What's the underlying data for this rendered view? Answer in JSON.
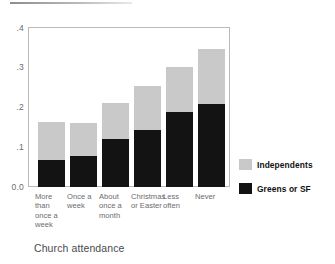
{
  "chart_data": {
    "type": "bar",
    "subtype": "stacked",
    "title": "",
    "xlabel": "Church attendance",
    "ylabel": "",
    "ylim": [
      0.0,
      0.4
    ],
    "yticks": [
      "0.0",
      ".1",
      ".2",
      ".3",
      ".4"
    ],
    "ytick_values": [
      0.0,
      0.1,
      0.2,
      0.3,
      0.4
    ],
    "grid": false,
    "legend_position": "right",
    "categories": [
      "More than once a week",
      "Once a week",
      "About once a month",
      "Christmas or Easter",
      "Less often",
      "Never"
    ],
    "category_labels": [
      "More\nthan\nonce a\nweek",
      "Once a\nweek",
      "About\nonce a\nmonth",
      "Christmas\nor Easter",
      "Less\noften",
      "Never"
    ],
    "series": [
      {
        "name": "Greens or SF",
        "color": "#131313",
        "values": [
          0.068,
          0.077,
          0.122,
          0.143,
          0.188,
          0.21
        ]
      },
      {
        "name": "Independents",
        "color": "#c9c9c9",
        "values": [
          0.095,
          0.085,
          0.09,
          0.11,
          0.115,
          0.138
        ]
      }
    ],
    "totals": [
      0.163,
      0.162,
      0.212,
      0.253,
      0.303,
      0.348
    ]
  },
  "axis": {
    "y_labels": [
      {
        "text": ".4",
        "value": 0.4
      },
      {
        "text": ".3",
        "value": 0.3
      },
      {
        "text": ".2",
        "value": 0.2
      },
      {
        "text": ".1",
        "value": 0.1
      },
      {
        "text": "0.0",
        "value": 0.0
      }
    ],
    "x_title": "Church attendance"
  },
  "legend": {
    "entries": [
      {
        "label": "Independents",
        "color": "#c9c9c9"
      },
      {
        "label": "Greens or SF",
        "color": "#131313"
      }
    ]
  },
  "x_labels": [
    {
      "line1": "More",
      "line2": "than",
      "line3": "once a",
      "line4": "week"
    },
    {
      "line1": "Once a",
      "line2": "week",
      "line3": "",
      "line4": ""
    },
    {
      "line1": "About",
      "line2": "once a",
      "line3": "month",
      "line4": ""
    },
    {
      "line1": "Christmas",
      "line2": "or Easter",
      "line3": "",
      "line4": ""
    },
    {
      "line1": "Less",
      "line2": "often",
      "line3": "",
      "line4": ""
    },
    {
      "line1": "Never",
      "line2": "",
      "line3": "",
      "line4": ""
    }
  ]
}
